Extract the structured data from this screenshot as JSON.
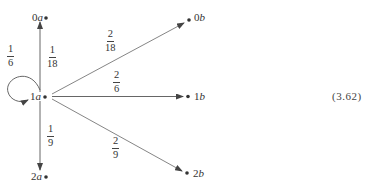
{
  "diagram": {
    "type": "transition-graph",
    "nodes": [
      {
        "id": "0a",
        "num": "0",
        "letter": "a",
        "x": 46,
        "y": 18
      },
      {
        "id": "1a",
        "num": "1",
        "letter": "a",
        "x": 44,
        "y": 96
      },
      {
        "id": "2a",
        "num": "2",
        "letter": "a",
        "x": 46,
        "y": 177
      },
      {
        "id": "0b",
        "num": "0",
        "letter": "b",
        "x": 190,
        "y": 20
      },
      {
        "id": "1b",
        "num": "1",
        "letter": "b",
        "x": 188,
        "y": 96
      },
      {
        "id": "2b",
        "num": "2",
        "letter": "b",
        "x": 187,
        "y": 173
      }
    ],
    "edges": [
      {
        "from": "1a",
        "to": "1a",
        "label": {
          "num": "1",
          "den": "6"
        },
        "kind": "self-loop"
      },
      {
        "from": "1a",
        "to": "0a",
        "label": {
          "num": "1",
          "den": "18"
        }
      },
      {
        "from": "1a",
        "to": "2a",
        "label": {
          "num": "1",
          "den": "9"
        }
      },
      {
        "from": "1a",
        "to": "0b",
        "label": {
          "num": "2",
          "den": "18"
        }
      },
      {
        "from": "1a",
        "to": "1b",
        "label": {
          "num": "2",
          "den": "6"
        }
      },
      {
        "from": "1a",
        "to": "2b",
        "label": {
          "num": "2",
          "den": "9"
        }
      }
    ],
    "equation_number": "(3.62)",
    "colors": {
      "stroke": "#555555",
      "text": "#333333",
      "background": "#ffffff"
    }
  }
}
